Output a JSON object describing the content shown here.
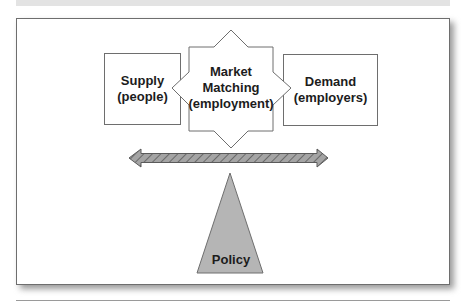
{
  "figure": {
    "caption_visible": "",
    "frame_style": "bordered box with drop shadow"
  },
  "nodes": {
    "supply": {
      "line1": "Supply",
      "line2": "(people)",
      "shape": "rectangle"
    },
    "market": {
      "line1": "Market",
      "line2": "Matching",
      "line3": "(employment)",
      "shape": "8-point star"
    },
    "demand": {
      "line1": "Demand",
      "line2": "(employers)",
      "shape": "rectangle"
    },
    "policy": {
      "label": "Policy",
      "shape": "triangle (fulcrum)"
    }
  },
  "balance_arrow": {
    "type": "double-headed",
    "pattern": "diagonal hatch"
  },
  "colors": {
    "stroke": "#6e6e6e",
    "arrow_fill": "#9c9c9c",
    "arrow_hatch": "#6a6a6a",
    "triangle_fill": "#b5b5b5",
    "text": "#1c1c1c"
  }
}
